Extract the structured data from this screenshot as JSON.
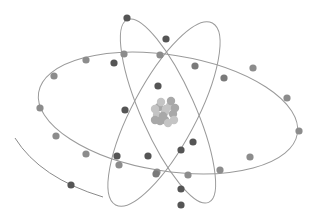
{
  "image": {
    "subject": "atom illustration",
    "width": 317,
    "height": 224,
    "background": "#ffffff"
  },
  "colors": {
    "orbit": "#9a9a9a",
    "electron_dark": "#555555",
    "electron_mid": "#7a7a7a",
    "electron_light": "#8c8c8c",
    "nucleus_a": "#a8a8a8",
    "nucleus_b": "#c4c4c4"
  },
  "orbits": [
    {
      "name": "horizontal-orbit",
      "cx": 168,
      "cy": 113,
      "rx": 131,
      "ry": 58,
      "rotate": 9
    },
    {
      "name": "tilted-orbit-left",
      "cx": 164,
      "cy": 114,
      "rx": 103,
      "ry": 32,
      "rotate": -62
    },
    {
      "name": "tilted-orbit-right",
      "cx": 168,
      "cy": 111,
      "rx": 100,
      "ry": 27,
      "rotate": 66
    }
  ],
  "electrons": [
    {
      "x": 127,
      "y": 18,
      "shade": "dark"
    },
    {
      "x": 166,
      "y": 39,
      "shade": "dark"
    },
    {
      "x": 114,
      "y": 63,
      "shade": "dark"
    },
    {
      "x": 124,
      "y": 54,
      "shade": "light"
    },
    {
      "x": 86,
      "y": 60,
      "shade": "light"
    },
    {
      "x": 54,
      "y": 76,
      "shade": "light"
    },
    {
      "x": 40,
      "y": 108,
      "shade": "light"
    },
    {
      "x": 56,
      "y": 136,
      "shade": "light"
    },
    {
      "x": 86,
      "y": 154,
      "shade": "light"
    },
    {
      "x": 119,
      "y": 165,
      "shade": "light"
    },
    {
      "x": 157,
      "y": 172,
      "shade": "light"
    },
    {
      "x": 188,
      "y": 175,
      "shade": "light"
    },
    {
      "x": 220,
      "y": 170,
      "shade": "light"
    },
    {
      "x": 250,
      "y": 157,
      "shade": "light"
    },
    {
      "x": 299,
      "y": 131,
      "shade": "light"
    },
    {
      "x": 287,
      "y": 98,
      "shade": "light"
    },
    {
      "x": 253,
      "y": 68,
      "shade": "light"
    },
    {
      "x": 224,
      "y": 78,
      "shade": "mid"
    },
    {
      "x": 195,
      "y": 66,
      "shade": "mid"
    },
    {
      "x": 160,
      "y": 55,
      "shade": "light"
    },
    {
      "x": 193,
      "y": 142,
      "shade": "dark"
    },
    {
      "x": 158,
      "y": 86,
      "shade": "dark"
    },
    {
      "x": 181,
      "y": 150,
      "shade": "dark"
    },
    {
      "x": 125,
      "y": 110,
      "shade": "dark"
    },
    {
      "x": 148,
      "y": 156,
      "shade": "dark"
    },
    {
      "x": 117,
      "y": 156,
      "shade": "dark"
    },
    {
      "x": 156,
      "y": 174,
      "shade": "mid"
    },
    {
      "x": 181,
      "y": 189,
      "shade": "dark"
    },
    {
      "x": 181,
      "y": 205,
      "shade": "dark"
    },
    {
      "x": 71,
      "y": 185,
      "shade": "dark"
    }
  ],
  "partial_arc": {
    "d": "M15 138 Q40 178 103 197"
  },
  "nucleus": {
    "cx": 165,
    "cy": 112,
    "r": 15
  }
}
